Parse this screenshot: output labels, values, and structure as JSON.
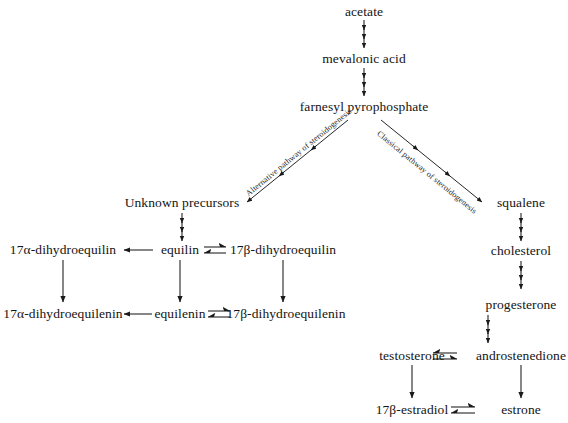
{
  "diagram": {
    "background_color": "#ffffff",
    "text_color": "#141414",
    "line_color": "#1a1a1a",
    "nodes": {
      "acetate": "acetate",
      "mevalonic_acid": "mevalonic acid",
      "farnesyl_pyrophosphate": "farnesyl pyrophosphate",
      "unknown_precursors": "Unknown precursors",
      "squalene": "squalene",
      "cholesterol": "cholesterol",
      "progesterone": "progesterone",
      "testosterone": "testosterone",
      "androstenedione": "androstenedione",
      "estradiol_17b": "17β-estradiol",
      "estrone": "estrone",
      "equilin": "equilin",
      "dihydroequilin_17a": "17α-dihydroequilin",
      "dihydroequilin_17b": "17β-dihydroequilin",
      "equilenin": "equilenin",
      "dihydroequilenin_17a": "17α-dihydroequilenin",
      "dihydroequilenin_17b": "17β-dihydroequilenin"
    },
    "pathway_labels": {
      "alternative": "Alternative pathway of steroidogenesis",
      "classical": "Classical pathway of steroidogenesis"
    }
  }
}
